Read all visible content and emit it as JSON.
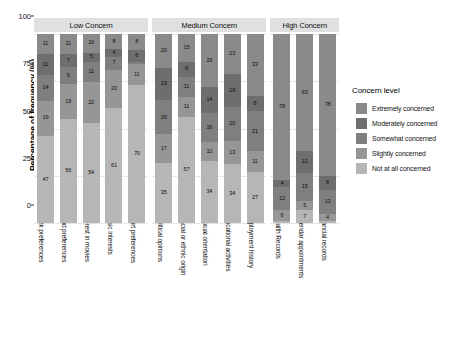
{
  "chart_data": {
    "type": "bar",
    "subtype": "stacked-percent-bar-faceted",
    "title": "",
    "xlabel": "",
    "ylabel": "Percentage of frequency (%)",
    "ylim": [
      0,
      100
    ],
    "yticks": [
      0,
      25,
      50,
      75,
      100
    ],
    "ytick_labels": [
      "0",
      "25",
      "50",
      "75",
      "100"
    ],
    "grid": true,
    "legend_position": "right",
    "legend_title": "Concern level",
    "series": [
      {
        "name": "Extremely concerned",
        "color": "#8a8a8a"
      },
      {
        "name": "Moderately concerned",
        "color": "#6e6e6e"
      },
      {
        "name": "Somewhat concerned",
        "color": "#7f7f7f"
      },
      {
        "name": "Slightly concerned",
        "color": "#969696"
      },
      {
        "name": "Not at all concerned",
        "color": "#b6b6b6"
      }
    ],
    "facets": [
      {
        "label": "Low Concern",
        "categories": [
          "Drink preferences",
          "Food preferences",
          "Interest in movies",
          "Music interests",
          "Sport preferences"
        ],
        "stacks": [
          [
            11,
            11,
            14,
            19,
            47
          ],
          [
            11,
            7,
            9,
            19,
            56
          ],
          [
            10,
            5,
            11,
            22,
            54
          ],
          [
            8,
            4,
            7,
            20,
            61
          ],
          [
            8,
            6,
            1,
            11,
            70
          ]
        ]
      },
      {
        "label": "Medium Concern",
        "categories": [
          "*Political opinions",
          "*Racial or ethnic origin",
          "*Sexual orientation",
          "Educational activities",
          "Employment history"
        ],
        "stacks": [
          [
            20,
            19,
            20,
            17,
            35
          ],
          [
            15,
            8,
            11,
            11,
            57
          ],
          [
            29,
            14,
            16,
            10,
            34
          ],
          [
            23,
            19,
            20,
            13,
            34
          ],
          [
            33,
            8,
            21,
            11,
            27
          ]
        ]
      },
      {
        "label": "High Concern",
        "categories": [
          "*Health Records",
          "Calendar appointments",
          "Financial records"
        ],
        "stacks": [
          [
            78,
            4,
            12,
            6,
            1
          ],
          [
            63,
            12,
            15,
            5,
            7
          ],
          [
            78,
            8,
            13,
            4,
            1
          ]
        ]
      }
    ]
  },
  "legend": {
    "title": "Concern level",
    "items": [
      {
        "label": "Extremely concerned",
        "color": "#8a8a8a"
      },
      {
        "label": "Moderately concerned",
        "color": "#6e6e6e"
      },
      {
        "label": "Somewhat concerned",
        "color": "#7f7f7f"
      },
      {
        "label": "Slightly concerned",
        "color": "#969696"
      },
      {
        "label": "Not at all concerned",
        "color": "#b6b6b6"
      }
    ]
  },
  "axis": {
    "y_title": "Percentage of frequency (%)"
  }
}
